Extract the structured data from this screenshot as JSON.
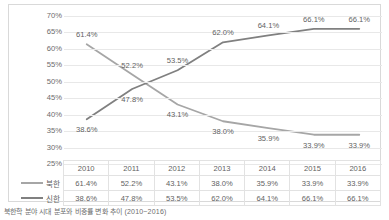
{
  "caption": "북한학 분야 시대 분포와 비중률 변화 추이 (2010~2016)",
  "chart_data": {
    "type": "line",
    "title": "",
    "xlabel": "",
    "ylabel": "",
    "ylim": [
      25,
      70
    ],
    "ytick_labels": [
      "70%",
      "65%",
      "60%",
      "55%",
      "50%",
      "45%",
      "40%",
      "35%",
      "30%",
      "25%"
    ],
    "ytick_values": [
      70,
      65,
      60,
      55,
      50,
      45,
      40,
      35,
      30,
      25
    ],
    "grid": true,
    "legend_position": "bottom-left-table",
    "categories": [
      "2010",
      "2011",
      "2012",
      "2013",
      "2014",
      "2015",
      "2016"
    ],
    "series": [
      {
        "name": "북한",
        "color": "#a6a6a6",
        "values": [
          61.4,
          52.2,
          43.1,
          38.0,
          35.9,
          33.9,
          33.9
        ],
        "labels": [
          "61.4%",
          "52.2%",
          "43.1%",
          "38.0%",
          "35.9%",
          "33.9%",
          "33.9%"
        ]
      },
      {
        "name": "신한",
        "color": "#808080",
        "values": [
          38.6,
          47.8,
          53.5,
          62.0,
          64.1,
          66.1,
          66.1
        ],
        "labels": [
          "38.6%",
          "47.8%",
          "53.5%",
          "62.0%",
          "64.1%",
          "66.1%",
          "66.1%"
        ]
      }
    ]
  },
  "table": {
    "header": [
      "",
      "2010",
      "2011",
      "2012",
      "2013",
      "2014",
      "2015",
      "2016"
    ],
    "rows": [
      {
        "label": "북한",
        "values": [
          "61.4%",
          "52.2%",
          "43.1%",
          "38.0%",
          "35.9%",
          "33.9%",
          "33.9%"
        ]
      },
      {
        "label": "신한",
        "values": [
          "38.6%",
          "47.8%",
          "53.5%",
          "62.0%",
          "64.1%",
          "66.1%",
          "66.1%"
        ]
      }
    ]
  }
}
